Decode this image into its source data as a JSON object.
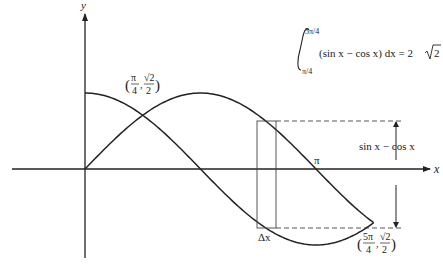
{
  "axes": {
    "x_label": "x",
    "y_label": "y",
    "x_tick_pi": "π"
  },
  "curves": [
    {
      "name": "sin x",
      "function": "sin"
    },
    {
      "name": "cos x",
      "function": "cos"
    }
  ],
  "points": {
    "left_intersection": {
      "x_num": "π",
      "x_den": "4",
      "y_num": "√2",
      "y_den": "2",
      "x_value": "π/4",
      "y_value": "√2/2"
    },
    "right_intersection": {
      "x_num": "5π",
      "x_den": "4",
      "y_num": "√2",
      "y_den": "2",
      "x_value": "5π/4",
      "y_value": "-√2/2"
    }
  },
  "integral": {
    "upper": "5π/4",
    "lower": "π/4",
    "integrand": "(sin x − cos x) dx = 2",
    "result_radicand": "2"
  },
  "annotations": {
    "height_label": "sin x − cos x",
    "width_label": "Δx"
  }
}
